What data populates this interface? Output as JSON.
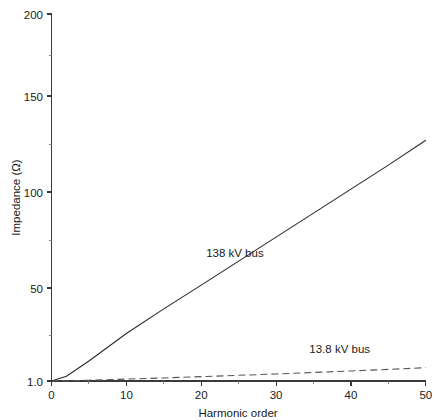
{
  "chart_data": {
    "type": "line",
    "title": "",
    "xlabel": "Harmonic order",
    "ylabel": "Impedance (Ω)",
    "xlim": [
      0,
      50
    ],
    "ylim": [
      1.0,
      200
    ],
    "grid": false,
    "legend_position": "inline-annotation",
    "xticks": [
      0,
      10,
      20,
      30,
      40,
      50
    ],
    "xticklabels": [
      "0",
      "10",
      "20",
      "30",
      "40",
      "50"
    ],
    "yticks": [
      1.0,
      50,
      100,
      150,
      200
    ],
    "yticklabels": [
      "1.0",
      "50",
      "100",
      "150",
      "200"
    ],
    "x": [
      0,
      2,
      5,
      10,
      15,
      20,
      25,
      30,
      35,
      40,
      45,
      50
    ],
    "series": [
      {
        "name": "138 kV bus",
        "style": "solid",
        "color": "#2b2b2b",
        "values": [
          1.0,
          3.5,
          11.5,
          26.0,
          39.0,
          51.5,
          64.0,
          76.5,
          89.0,
          101.5,
          114.0,
          127.0
        ]
      },
      {
        "name": "13.8 kV bus",
        "style": "dashed",
        "color": "#555555",
        "values": [
          1.0,
          1.1,
          1.4,
          2.0,
          2.6,
          3.3,
          4.0,
          4.7,
          5.5,
          6.3,
          7.1,
          8.0
        ]
      }
    ],
    "annotations": [
      {
        "text": "138 kV bus",
        "x": 24.5,
        "y": 66.0
      },
      {
        "text": "13.8 kV bus",
        "x": 38.5,
        "y": 15.5
      }
    ]
  },
  "axes": {
    "y_axis_name": "Impedance (Ω)",
    "x_axis_name": "Harmonic order"
  }
}
